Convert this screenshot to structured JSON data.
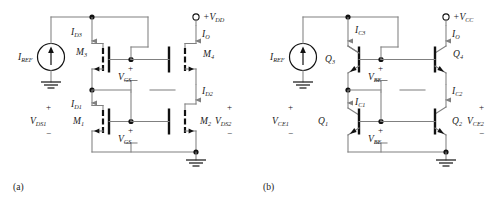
{
  "figure": {
    "caption_a": "(a)",
    "caption_b": "(b)",
    "accent_wire_color": "#808080",
    "device_color": "#111111"
  },
  "circuit_a": {
    "name": "MOSFET cascode current mirror",
    "supply": {
      "label": "+V",
      "sub": "DD"
    },
    "source": {
      "label": "I",
      "sub": "REF"
    },
    "currents": [
      {
        "id": "id3",
        "label": "I",
        "sub": "D3"
      },
      {
        "id": "io",
        "label": "I",
        "sub": "O"
      },
      {
        "id": "id1",
        "label": "I",
        "sub": "D1"
      },
      {
        "id": "id2",
        "label": "I",
        "sub": "D2"
      }
    ],
    "devices": [
      {
        "id": "m3",
        "label": "M",
        "sub": "3"
      },
      {
        "id": "m4",
        "label": "M",
        "sub": "4"
      },
      {
        "id": "m1",
        "label": "M",
        "sub": "1"
      },
      {
        "id": "m2",
        "label": "M",
        "sub": "2"
      }
    ],
    "voltages": [
      {
        "id": "vgs_top",
        "label": "V",
        "sub": "GS",
        "plus": "+",
        "minus": "−"
      },
      {
        "id": "vgs_bot",
        "label": "V",
        "sub": "GS",
        "plus": "+",
        "minus": "−"
      },
      {
        "id": "vds1",
        "label": "V",
        "sub": "DS1",
        "plus": "+",
        "minus": "−"
      },
      {
        "id": "vds2",
        "label": "V",
        "sub": "DS2",
        "plus": "+",
        "minus": "−"
      }
    ]
  },
  "circuit_b": {
    "name": "BJT cascode current mirror",
    "supply": {
      "label": "+V",
      "sub": "CC"
    },
    "source": {
      "label": "I",
      "sub": "REF"
    },
    "currents": [
      {
        "id": "ic3",
        "label": "I",
        "sub": "C3"
      },
      {
        "id": "io",
        "label": "I",
        "sub": "O"
      },
      {
        "id": "ic1",
        "label": "I",
        "sub": "C1"
      },
      {
        "id": "ic2",
        "label": "I",
        "sub": "C2"
      }
    ],
    "devices": [
      {
        "id": "q3",
        "label": "Q",
        "sub": "3"
      },
      {
        "id": "q4",
        "label": "Q",
        "sub": "4"
      },
      {
        "id": "q1",
        "label": "Q",
        "sub": "1"
      },
      {
        "id": "q2",
        "label": "Q",
        "sub": "2"
      }
    ],
    "voltages": [
      {
        "id": "vbe_top",
        "label": "V",
        "sub": "BE",
        "plus": "+",
        "minus": "−"
      },
      {
        "id": "vbe_bot",
        "label": "V",
        "sub": "BE",
        "plus": "+",
        "minus": "−"
      },
      {
        "id": "vce1",
        "label": "V",
        "sub": "CE1",
        "plus": "+",
        "minus": "−"
      },
      {
        "id": "vce2",
        "label": "V",
        "sub": "CE2",
        "plus": "+",
        "minus": "−"
      }
    ]
  }
}
